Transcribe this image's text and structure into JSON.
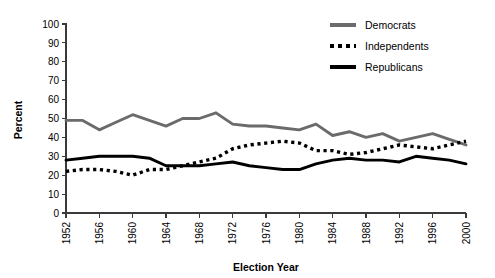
{
  "chart_data": {
    "type": "line",
    "title": "",
    "xlabel": "Election Year",
    "ylabel": "Percent",
    "ylim": [
      0,
      100
    ],
    "ytick_step": 10,
    "yticks": [
      0,
      10,
      20,
      30,
      40,
      50,
      60,
      70,
      80,
      90,
      100
    ],
    "grid": false,
    "legend_position": "top-right",
    "categories": [
      1952,
      1956,
      1960,
      1964,
      1968,
      1972,
      1976,
      1980,
      1984,
      1988,
      1992,
      1996,
      2000
    ],
    "xtick_labels_shown": [
      "1952",
      "1956",
      "1960",
      "1964",
      "1968",
      "1972",
      "1976",
      "1980",
      "1984",
      "1988",
      "1992",
      "1996",
      "2000"
    ],
    "series": [
      {
        "name": "Democrats",
        "color": "#6b6b6b",
        "style": "solid",
        "x": [
          1952,
          1954,
          1956,
          1958,
          1960,
          1962,
          1964,
          1966,
          1968,
          1970,
          1972,
          1974,
          1976,
          1978,
          1980,
          1982,
          1984,
          1986,
          1988,
          1990,
          1992,
          1994,
          1996,
          1998,
          2000
        ],
        "values": [
          49,
          49,
          44,
          48,
          52,
          49,
          46,
          50,
          50,
          53,
          47,
          46,
          46,
          45,
          44,
          47,
          41,
          43,
          40,
          42,
          38,
          40,
          42,
          39,
          36
        ]
      },
      {
        "name": "Independents",
        "color": "#000000",
        "style": "dotted",
        "x": [
          1952,
          1954,
          1956,
          1958,
          1960,
          1962,
          1964,
          1966,
          1968,
          1970,
          1972,
          1974,
          1976,
          1978,
          1980,
          1982,
          1984,
          1986,
          1988,
          1990,
          1992,
          1994,
          1996,
          1998,
          2000
        ],
        "values": [
          22,
          23,
          23,
          22,
          20,
          23,
          23,
          25,
          27,
          29,
          34,
          36,
          37,
          38,
          37,
          33,
          33,
          31,
          32,
          34,
          36,
          35,
          34,
          36,
          38
        ]
      },
      {
        "name": "Republicans",
        "color": "#000000",
        "style": "solid",
        "x": [
          1952,
          1954,
          1956,
          1958,
          1960,
          1962,
          1964,
          1966,
          1968,
          1970,
          1972,
          1974,
          1976,
          1978,
          1980,
          1982,
          1984,
          1986,
          1988,
          1990,
          1992,
          1994,
          1996,
          1998,
          2000
        ],
        "values": [
          28,
          29,
          30,
          30,
          30,
          29,
          25,
          25,
          25,
          26,
          27,
          25,
          24,
          23,
          23,
          26,
          28,
          29,
          28,
          28,
          27,
          30,
          29,
          28,
          26
        ]
      }
    ]
  },
  "legend": {
    "items": [
      {
        "label": "Democrats",
        "swatch": "solid-gray-line-swatch"
      },
      {
        "label": "Independents",
        "swatch": "dotted-black-line-swatch"
      },
      {
        "label": "Republicans",
        "swatch": "solid-black-line-swatch"
      }
    ]
  },
  "colors": {
    "democrats": "#6b6b6b",
    "independents": "#000000",
    "republicans": "#000000",
    "axis": "#3a3a3a",
    "background": "#ffffff"
  }
}
